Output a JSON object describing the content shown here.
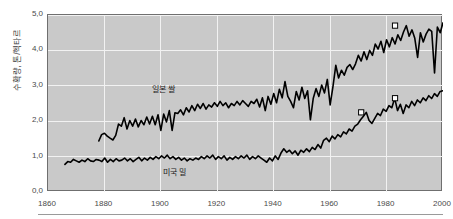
{
  "chart_data": {
    "type": "line",
    "title": "",
    "xlabel": "",
    "ylabel": "수확량, 톤/헥타르",
    "xlim": [
      1860,
      2000
    ],
    "ylim": [
      0.0,
      5.0
    ],
    "grid": true,
    "legend_position": "inline-annotation",
    "x_ticks": [
      "1860",
      "1880",
      "1900",
      "1920",
      "1940",
      "1960",
      "1980",
      "2000"
    ],
    "x_tick_values": [
      1860,
      1880,
      1900,
      1920,
      1940,
      1960,
      1980,
      2000
    ],
    "y_ticks": [
      "0,0",
      "1,0",
      "2,0",
      "3,0",
      "4,0",
      "5,0"
    ],
    "y_tick_values": [
      0.0,
      1.0,
      2.0,
      3.0,
      4.0,
      5.0
    ],
    "series": [
      {
        "name": "일본 쌀",
        "label": "일본 쌀",
        "color": "#000000",
        "x_start": 1878,
        "x_end": 2000,
        "values": [
          1.44,
          1.62,
          1.66,
          1.58,
          1.52,
          1.47,
          1.6,
          1.92,
          1.86,
          2.1,
          1.78,
          2.02,
          1.86,
          2.06,
          1.84,
          2.02,
          1.9,
          2.12,
          1.92,
          2.14,
          1.9,
          2.18,
          1.74,
          2.2,
          1.98,
          2.3,
          1.74,
          2.24,
          2.22,
          2.32,
          2.18,
          2.38,
          2.26,
          2.44,
          2.3,
          2.48,
          2.36,
          2.5,
          2.34,
          2.46,
          2.4,
          2.52,
          2.42,
          2.56,
          2.44,
          2.52,
          2.38,
          2.5,
          2.44,
          2.56,
          2.46,
          2.58,
          2.5,
          2.42,
          2.56,
          2.5,
          2.62,
          2.4,
          2.66,
          2.3,
          2.7,
          2.48,
          2.78,
          2.52,
          2.9,
          2.66,
          3.12,
          2.7,
          2.56,
          2.38,
          2.84,
          2.6,
          2.96,
          2.64,
          2.86,
          2.04,
          2.64,
          2.92,
          2.7,
          3.02,
          2.8,
          3.18,
          2.46,
          2.98,
          3.58,
          3.22,
          3.44,
          3.3,
          3.52,
          3.6,
          3.46,
          3.62,
          3.86,
          3.7,
          3.96,
          3.74,
          4.0,
          3.86,
          4.18,
          4.04,
          4.26,
          3.94,
          4.3,
          4.1,
          4.36,
          4.18,
          4.44,
          4.28,
          4.52,
          4.7,
          4.4,
          4.58,
          4.34,
          3.8,
          4.5,
          4.24,
          4.46,
          4.6,
          4.54,
          3.36,
          4.66,
          4.5,
          4.78
        ],
        "markers": [
          {
            "x": 1983,
            "y": 4.7,
            "style": "open-square"
          }
        ]
      },
      {
        "name": "미국 밀",
        "label": "미국 밀",
        "color": "#000000",
        "x_start": 1866,
        "x_end": 2000,
        "values": [
          0.78,
          0.86,
          0.84,
          0.92,
          0.88,
          0.84,
          0.9,
          0.86,
          0.94,
          0.88,
          0.86,
          0.92,
          0.9,
          0.86,
          0.96,
          0.84,
          0.92,
          0.86,
          0.94,
          0.88,
          0.9,
          0.96,
          0.88,
          0.94,
          0.86,
          0.92,
          0.98,
          0.88,
          0.96,
          0.9,
          0.98,
          0.92,
          1.0,
          0.94,
          1.02,
          0.96,
          1.04,
          0.94,
          1.0,
          0.92,
          0.98,
          0.9,
          0.96,
          0.88,
          0.94,
          0.9,
          0.96,
          0.92,
          1.0,
          0.94,
          1.02,
          0.96,
          1.04,
          0.92,
          1.0,
          0.94,
          1.02,
          0.9,
          0.98,
          0.92,
          1.0,
          0.94,
          1.02,
          0.96,
          1.04,
          0.92,
          1.0,
          0.94,
          1.02,
          0.96,
          0.9,
          0.84,
          0.96,
          0.88,
          1.02,
          0.92,
          1.1,
          1.22,
          1.12,
          1.18,
          1.08,
          1.16,
          1.04,
          1.18,
          1.12,
          1.22,
          1.14,
          1.26,
          1.2,
          1.34,
          1.24,
          1.46,
          1.52,
          1.42,
          1.58,
          1.5,
          1.62,
          1.56,
          1.7,
          1.64,
          1.78,
          1.72,
          1.86,
          1.92,
          2.04,
          2.14,
          2.25,
          2.02,
          1.94,
          2.08,
          2.22,
          2.16,
          2.34,
          2.28,
          2.44,
          2.38,
          2.65,
          2.3,
          2.48,
          2.22,
          2.46,
          2.38,
          2.56,
          2.44,
          2.6,
          2.52,
          2.66,
          2.58,
          2.72,
          2.64,
          2.78,
          2.7,
          2.84,
          2.86
        ],
        "markers": [
          {
            "x": 1971,
            "y": 2.25,
            "style": "open-square"
          },
          {
            "x": 1983,
            "y": 2.65,
            "style": "open-square"
          }
        ]
      }
    ]
  },
  "axes": {
    "y_title": "수확량, 톤/헥타르"
  },
  "colors": {
    "plot_background": "#c9c9c9",
    "gridline": "#f2f2f2",
    "line": "#000000",
    "axis_text": "#4a4a4a",
    "frame": "#6f6f6f",
    "marker_fill": "#ffffff",
    "marker_stroke": "#000000"
  }
}
